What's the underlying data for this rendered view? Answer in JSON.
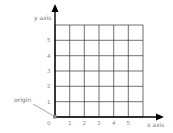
{
  "diagram": {
    "y_axis_label": "y axis",
    "x_axis_label": "x axis",
    "origin_label": "origin",
    "origin_tick": "0",
    "x_ticks": [
      "1",
      "2",
      "3",
      "4",
      "5"
    ],
    "y_ticks": [
      "1",
      "2",
      "3",
      "4",
      "5"
    ],
    "grid": {
      "columns": 6,
      "rows": 6
    },
    "colors": {
      "axis": "#000000",
      "grid": "#333333",
      "label": "#777777",
      "origin_marker": "#888888"
    }
  }
}
